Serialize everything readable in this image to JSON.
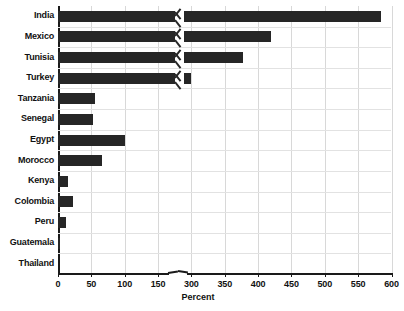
{
  "chart_data": {
    "type": "bar",
    "orientation": "horizontal",
    "title": "",
    "xlabel": "Percent",
    "ylabel": "",
    "categories": [
      "India",
      "Mexico",
      "Tunisia",
      "Turkey",
      "Tanzania",
      "Senegal",
      "Egypt",
      "Morocco",
      "Kenya",
      "Colombia",
      "Peru",
      "Guatemala",
      "Thailand"
    ],
    "values": [
      585,
      420,
      378,
      300,
      155,
      153,
      100,
      66,
      15,
      23,
      12,
      3,
      0
    ],
    "xticks": [
      0,
      50,
      100,
      150,
      300,
      350,
      400,
      450,
      500,
      550,
      600
    ],
    "xtick_labels": [
      "0",
      "50",
      "100",
      "150",
      "300",
      "350",
      "400",
      "450",
      "500",
      "550",
      "600"
    ],
    "xlim": [
      0,
      600
    ],
    "axis_break": {
      "from": 150,
      "to": 300,
      "marker": "zigzag"
    },
    "broken_bars": [
      "India",
      "Mexico",
      "Tunisia",
      "Turkey"
    ],
    "grid": true,
    "legend": false,
    "bar_color": "#262626",
    "grid_color": "#d8d8d8"
  },
  "axis": {
    "x_title": "Percent"
  }
}
